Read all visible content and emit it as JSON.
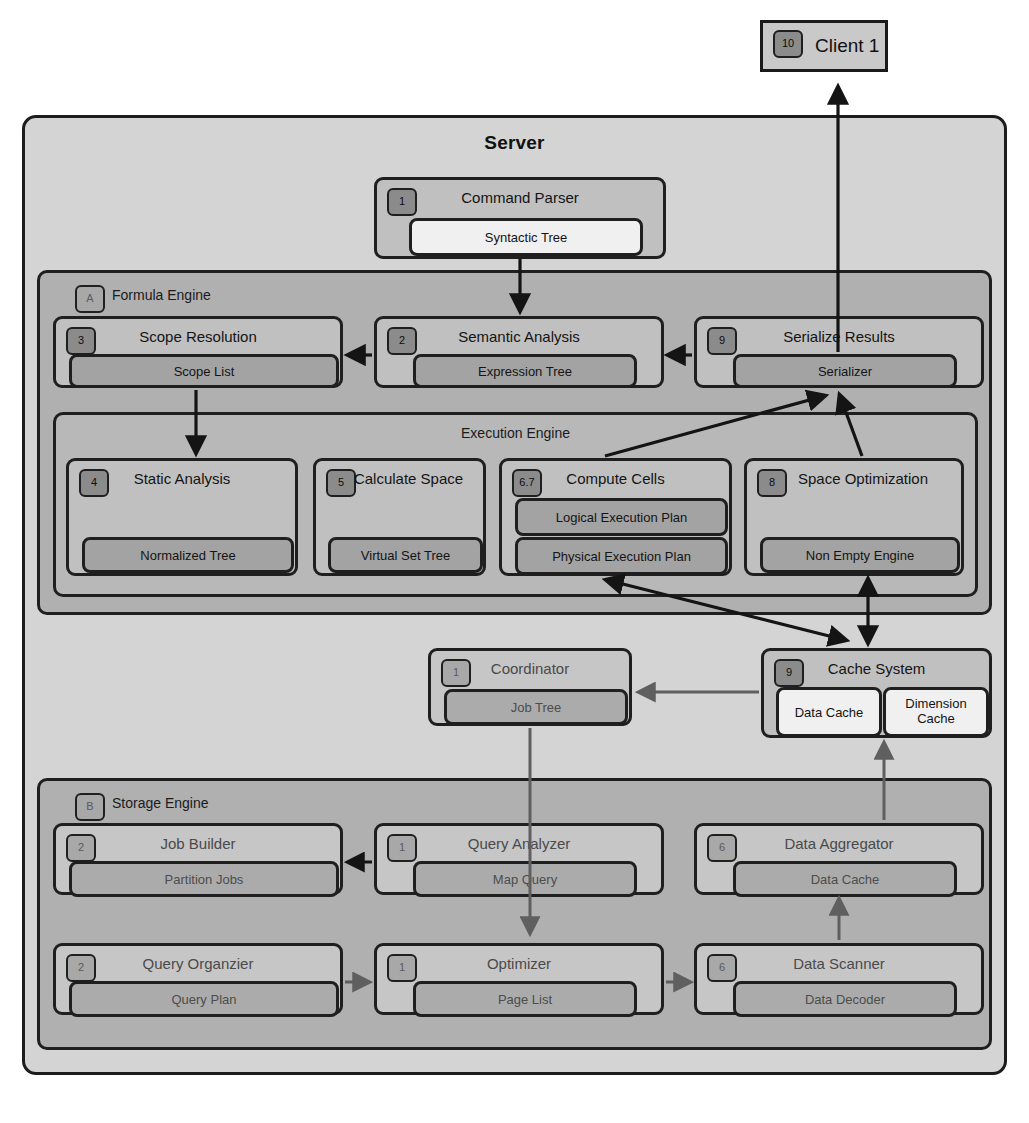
{
  "diagram": {
    "title": "Server",
    "client": {
      "badge": "10",
      "label": "Client 1"
    }
  },
  "command_parser": {
    "badge": "1",
    "title": "Command Parser",
    "pill": "Syntactic Tree"
  },
  "formula_engine": {
    "badge": "A",
    "label": "Formula Engine",
    "modules": [
      {
        "badge": "3",
        "title": "Scope Resolution",
        "pill": "Scope List"
      },
      {
        "badge": "2",
        "title": "Semantic Analysis",
        "pill": "Expression Tree"
      },
      {
        "badge": "9",
        "title": "Serialize Results",
        "pill": "Serializer"
      }
    ]
  },
  "execution_engine": {
    "label": "Execution Engine",
    "modules": [
      {
        "badge": "4",
        "title": "Static Analysis",
        "pills": [
          "Normalized Tree"
        ]
      },
      {
        "badge": "5",
        "title": "Calculate Space",
        "pills": [
          "Virtual Set Tree"
        ]
      },
      {
        "badge": "6.7",
        "title": "Compute Cells",
        "pills": [
          "Logical Execution Plan",
          "Physical Execution Plan"
        ]
      },
      {
        "badge": "8",
        "title": "Space Optimization",
        "pills": [
          "Non Empty Engine"
        ]
      }
    ]
  },
  "coordinator": {
    "badge": "1",
    "title": "Coordinator",
    "pill": "Job Tree"
  },
  "cache_system": {
    "badge": "9",
    "title": "Cache System",
    "caches": [
      "Data Cache",
      "Dimension Cache"
    ]
  },
  "storage_engine": {
    "badge": "B",
    "label": "Storage Engine",
    "modules": [
      {
        "badge": "2",
        "title": "Job Builder",
        "pill": "Partition Jobs"
      },
      {
        "badge": "1",
        "title": "Query Analyzer",
        "pill": "Map Query"
      },
      {
        "badge": "6",
        "title": "Data Aggregator",
        "pill": "Data Cache"
      },
      {
        "badge": "2",
        "title": "Query Organzier",
        "pill": "Query Plan"
      },
      {
        "badge": "1",
        "title": "Optimizer",
        "pill": "Page List"
      },
      {
        "badge": "6",
        "title": "Data Scanner",
        "pill": "Data Decoder"
      }
    ]
  },
  "colors": {
    "page_background": "#ffffff",
    "server_fill": "#d4d4d4",
    "group_fill": "#b0b0b0",
    "card_fill": "#c0c0c0",
    "pill_fill": "#a3a3a3",
    "pill_white": "#f0f0f0",
    "stroke": "#1f1f1f",
    "badge_fill": "#9a9a9a"
  }
}
